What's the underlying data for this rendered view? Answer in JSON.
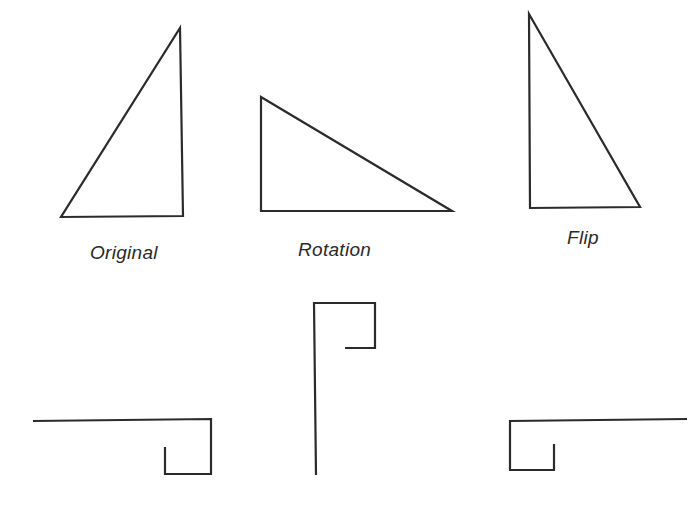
{
  "figure": {
    "stroke_color": "#2b2b2b",
    "label_color": "#2a2a2a",
    "background": "#ffffff",
    "triangles": [
      {
        "name": "original",
        "label": "Original",
        "points": [
          [
            180,
            28
          ],
          [
            183,
            216
          ],
          [
            61,
            217
          ]
        ],
        "label_pos": [
          90,
          243
        ]
      },
      {
        "name": "rotation",
        "label": "Rotation",
        "points": [
          [
            261,
            97
          ],
          [
            452,
            211
          ],
          [
            261,
            211
          ]
        ],
        "label_pos": [
          298,
          240
        ]
      },
      {
        "name": "flip",
        "label": "Flip",
        "points": [
          [
            529,
            14
          ],
          [
            640,
            207
          ],
          [
            530,
            208
          ]
        ],
        "label_pos": [
          567,
          228
        ]
      }
    ],
    "hooks": [
      {
        "name": "hook-left",
        "points": [
          [
            33,
            421
          ],
          [
            211,
            419
          ],
          [
            211,
            474
          ],
          [
            165,
            474
          ],
          [
            165,
            447
          ]
        ]
      },
      {
        "name": "hook-middle",
        "points": [
          [
            316,
            475
          ],
          [
            314,
            303
          ],
          [
            375,
            303
          ],
          [
            375,
            348
          ],
          [
            345,
            348
          ]
        ]
      },
      {
        "name": "hook-right",
        "points": [
          [
            687,
            419
          ],
          [
            510,
            421
          ],
          [
            510,
            470
          ],
          [
            554,
            470
          ],
          [
            554,
            444
          ]
        ]
      }
    ]
  }
}
